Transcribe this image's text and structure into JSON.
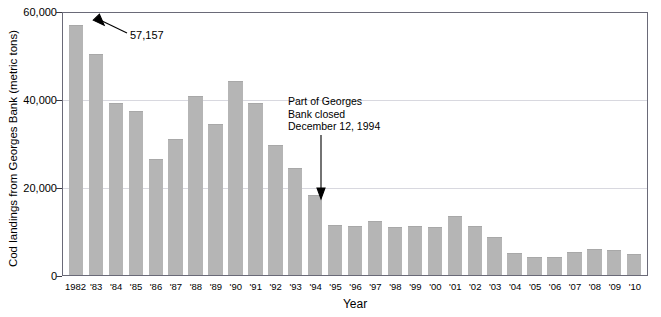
{
  "chart_data": {
    "type": "bar",
    "title": "",
    "xlabel": "Year",
    "ylabel": "Cod landings from Georges Bank (metric tons)",
    "ylim": [
      0,
      60000
    ],
    "yticks": [
      0,
      20000,
      40000,
      60000
    ],
    "ytick_labels": [
      "0",
      "20,000",
      "40,000",
      "60,000"
    ],
    "grid": true,
    "legend": "none",
    "bar_color": "#b5b5b5",
    "categories": [
      "1982",
      "'83",
      "'84",
      "'85",
      "'86",
      "'87",
      "'88",
      "'89",
      "'90",
      "'91",
      "'92",
      "'93",
      "'94",
      "'95",
      "'96",
      "'97",
      "'98",
      "'99",
      "'00",
      "'01",
      "'02",
      "'03",
      "'04",
      "'05",
      "'06",
      "'07",
      "'08",
      "'09",
      "'10"
    ],
    "values": [
      57157,
      50500,
      39500,
      37500,
      26500,
      31200,
      41000,
      34500,
      44500,
      39300,
      29800,
      24500,
      18300,
      11500,
      11200,
      12300,
      11000,
      11200,
      11000,
      13600,
      11200,
      8800,
      5000,
      4100,
      4200,
      5300,
      5900,
      5700,
      4900
    ],
    "annotations": [
      {
        "name": "peak-value-callout",
        "text": "57,157",
        "points_to_category": "1982"
      },
      {
        "name": "closure-note",
        "text": "Part of Georges\nBank closed\nDecember 12, 1994",
        "lines": [
          "Part of Georges",
          "Bank closed",
          "December 12, 1994"
        ],
        "points_to_category": "'94"
      }
    ]
  },
  "axes": {
    "y_title": "Cod landings from Georges Bank (metric tons)",
    "x_title": "Year",
    "y_tick_labels": [
      "60,000",
      "40,000",
      "20,000",
      "0"
    ]
  },
  "annotations": {
    "peak_value": "57,157",
    "closure_line1": "Part of Georges",
    "closure_line2": "Bank closed",
    "closure_line3": "December 12, 1994"
  }
}
